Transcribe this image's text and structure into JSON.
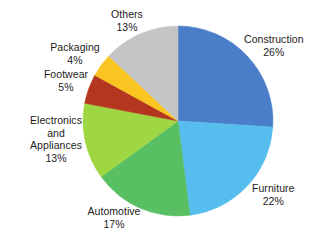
{
  "chart_data": {
    "type": "pie",
    "title": "",
    "subtitle": "",
    "xlabel": "",
    "ylabel": "",
    "legend_position": "none",
    "grid": false,
    "labels_show_percent": true,
    "start_angle_deg": 0,
    "direction": "clockwise",
    "categories": [
      "Construction",
      "Furniture",
      "Automotive",
      "Electronics and Appliances",
      "Footwear",
      "Packaging",
      "Others"
    ],
    "values": [
      26,
      22,
      17,
      13,
      5,
      4,
      13
    ],
    "colors": [
      "#4a7ec9",
      "#56bdee",
      "#58bf62",
      "#9fd644",
      "#b5361f",
      "#fbc521",
      "#c3c5c6"
    ],
    "slices": [
      {
        "label": "Construction",
        "value": 26,
        "value_text": "26%",
        "color": "#4a7ec9"
      },
      {
        "label": "Furniture",
        "value": 22,
        "value_text": "22%",
        "color": "#56bdee"
      },
      {
        "label": "Automotive",
        "value": 17,
        "value_text": "17%",
        "color": "#58bf62"
      },
      {
        "label": "Electronics and Appliances",
        "value": 13,
        "value_text": "13%",
        "color": "#9fd644"
      },
      {
        "label": "Footwear",
        "value": 5,
        "value_text": "5%",
        "color": "#b5361f"
      },
      {
        "label": "Packaging",
        "value": 4,
        "value_text": "4%",
        "color": "#fbc521"
      },
      {
        "label": "Others",
        "value": 13,
        "value_text": "13%",
        "color": "#c3c5c6"
      }
    ]
  },
  "labels": {
    "construction": {
      "name": "Construction",
      "value": "26%"
    },
    "furniture": {
      "name": "Furniture",
      "value": "22%"
    },
    "automotive": {
      "name": "Automotive",
      "value": "17%"
    },
    "electronics": {
      "name_line1": "Electronics",
      "name_line2": "and",
      "name_line3": "Appliances",
      "value": "13%"
    },
    "footwear": {
      "name": "Footwear",
      "value": "5%"
    },
    "packaging": {
      "name": "Packaging",
      "value": "4%"
    },
    "others": {
      "name": "Others",
      "value": "13%"
    }
  },
  "geometry": {
    "center_x": 178,
    "center_y": 121,
    "radius": 95
  },
  "style": {
    "background": "#ffffff",
    "text_color": "#1c1c1c"
  }
}
